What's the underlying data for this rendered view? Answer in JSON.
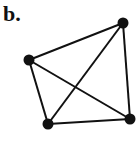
{
  "panel": {
    "label": "b."
  },
  "graph": {
    "nodes": [
      {
        "id": "top-right",
        "x": 123,
        "y": 23
      },
      {
        "id": "left",
        "x": 29,
        "y": 60
      },
      {
        "id": "bottom-left",
        "x": 48,
        "y": 124
      },
      {
        "id": "bottom-right",
        "x": 130,
        "y": 119
      }
    ],
    "edges": [
      [
        "left",
        "top-right"
      ],
      [
        "top-right",
        "bottom-right"
      ],
      [
        "bottom-left",
        "bottom-right"
      ],
      [
        "left",
        "bottom-left"
      ],
      [
        "left",
        "bottom-right"
      ],
      [
        "bottom-left",
        "top-right"
      ]
    ],
    "color": "#111111"
  }
}
